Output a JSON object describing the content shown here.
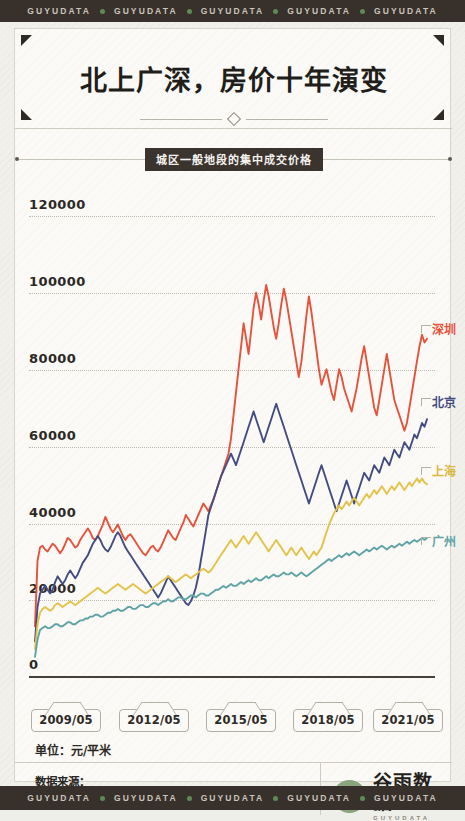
{
  "watermark": {
    "text": "GUYUDATA",
    "repeat": 5,
    "dot_color": "#5f8a58",
    "bar_color": "#38302b"
  },
  "header": {
    "title": "北上广深，房价十年演变",
    "subtitle": "城区一般地段的集中成交价格"
  },
  "axis": {
    "unit_label": "单位：元/平米",
    "zero_label": "0",
    "y_ticks": [
      "120000",
      "100000",
      "80000",
      "60000",
      "40000",
      "20000"
    ],
    "x_ticks": [
      "2009/05",
      "2012/05",
      "2015/05",
      "2018/05",
      "2021/05"
    ]
  },
  "legend": [
    {
      "name": "深圳",
      "color": "#e6523c"
    },
    {
      "name": "北京",
      "color": "#434c80"
    },
    {
      "name": "上海",
      "color": "#e3c34a"
    },
    {
      "name": "广州",
      "color": "#5fa3a5"
    }
  ],
  "footer": {
    "source_title": "数据来源：",
    "source_body": "国家信息中心 · 房地产信息网",
    "brand_cn": "谷雨数据",
    "brand_en": "GUYUDATA"
  },
  "chart_data": {
    "type": "line",
    "title": "北上广深，房价十年演变",
    "subtitle": "城区一般地段的集中成交价格",
    "xlabel": "",
    "ylabel": "元/平米",
    "ylim": [
      0,
      120000
    ],
    "xlim": [
      "2009/05",
      "2021/05"
    ],
    "grid": "horizontal-dotted",
    "legend_position": "right-inline",
    "y_tick_values": [
      0,
      20000,
      40000,
      60000,
      80000,
      100000,
      120000
    ],
    "x_tick_labels": [
      "2009/05",
      "2012/05",
      "2015/05",
      "2018/05",
      "2021/05"
    ],
    "x_start_month": "2009/05",
    "x_end_month": "2021/05",
    "series": [
      {
        "name": "深圳",
        "color": "#e6523c",
        "values": [
          13000,
          30000,
          33500,
          34000,
          33000,
          32500,
          33500,
          34500,
          34000,
          33000,
          32000,
          33000,
          34500,
          36000,
          35500,
          34500,
          33500,
          34000,
          35500,
          36500,
          37500,
          38500,
          37500,
          36000,
          35500,
          36500,
          38000,
          39500,
          41500,
          40000,
          38500,
          37500,
          38500,
          39500,
          38000,
          36500,
          35500,
          36500,
          37000,
          36000,
          35000,
          34000,
          33000,
          32000,
          31500,
          32500,
          33500,
          34000,
          33000,
          32500,
          33500,
          35000,
          36500,
          38000,
          37000,
          36000,
          35500,
          37000,
          38500,
          40000,
          42000,
          41000,
          40000,
          39000,
          40500,
          42000,
          43500,
          45000,
          44000,
          43000,
          44500,
          46000,
          48000,
          50000,
          52000,
          54000,
          56000,
          58000,
          62000,
          68000,
          74000,
          80000,
          86000,
          92000,
          88000,
          84000,
          90000,
          96000,
          100000,
          97000,
          93000,
          98000,
          102000,
          99000,
          95000,
          91000,
          88000,
          92000,
          97000,
          101000,
          98000,
          94000,
          90000,
          86000,
          82000,
          78000,
          82000,
          88000,
          94000,
          99000,
          95000,
          90000,
          85000,
          80000,
          76000,
          78000,
          80000,
          77000,
          74000,
          72000,
          76000,
          80000,
          78000,
          75000,
          73000,
          71000,
          69000,
          72000,
          75000,
          79000,
          83000,
          86000,
          82000,
          78000,
          74000,
          70000,
          68000,
          72000,
          76000,
          80000,
          84000,
          80000,
          76000,
          72000,
          70000,
          68000,
          66000,
          64000,
          66000,
          70000,
          74000,
          78000,
          82000,
          86000,
          89000,
          87000,
          88000
        ],
        "start_value": 13000,
        "end_value": 88000,
        "peak_value": 102000,
        "peak_label": "2016"
      },
      {
        "name": "北京",
        "color": "#434c80",
        "values": [
          9000,
          18000,
          21500,
          22500,
          23500,
          22500,
          21500,
          22500,
          24500,
          26000,
          25000,
          24000,
          25000,
          26500,
          27500,
          26500,
          25500,
          26500,
          28000,
          29500,
          30500,
          31500,
          33000,
          34500,
          35500,
          36500,
          35500,
          34000,
          33000,
          32500,
          33500,
          35000,
          36500,
          37500,
          36500,
          35000,
          33500,
          32500,
          31500,
          30500,
          29500,
          28500,
          27500,
          26500,
          25500,
          24500,
          23500,
          22500,
          21500,
          20500,
          21500,
          23000,
          24500,
          26000,
          25000,
          24000,
          23000,
          22000,
          21000,
          20000,
          19000,
          18500,
          19500,
          21000,
          23000,
          26000,
          30000,
          34000,
          38000,
          42000,
          44000,
          46000,
          48000,
          50000,
          52000,
          53500,
          55000,
          56500,
          58000,
          56500,
          55000,
          57000,
          59000,
          61000,
          63000,
          65000,
          67000,
          69000,
          67000,
          65000,
          63000,
          61000,
          63000,
          65000,
          67000,
          69000,
          71000,
          69000,
          67000,
          65000,
          63000,
          61000,
          59000,
          57000,
          55000,
          53000,
          51000,
          49000,
          47000,
          45000,
          47000,
          49000,
          51000,
          53000,
          55000,
          53000,
          51000,
          49000,
          47000,
          45000,
          43000,
          45000,
          47000,
          49000,
          51000,
          49000,
          47000,
          45000,
          47000,
          49000,
          51000,
          53000,
          52000,
          51000,
          53000,
          55000,
          54000,
          53000,
          55000,
          57000,
          56000,
          55000,
          57000,
          59000,
          58000,
          57000,
          59000,
          61000,
          60000,
          59000,
          61000,
          63000,
          62000,
          64000,
          66000,
          65000,
          67000
        ],
        "start_value": 9000,
        "end_value": 67000,
        "peak_value": 71000
      },
      {
        "name": "上海",
        "color": "#e3c34a",
        "values": [
          7000,
          13500,
          16500,
          17500,
          18000,
          17500,
          17000,
          17500,
          18500,
          19000,
          18500,
          18000,
          18500,
          19000,
          19500,
          19000,
          18500,
          19000,
          19500,
          20000,
          20500,
          21000,
          21500,
          22000,
          22500,
          23000,
          22500,
          22000,
          21500,
          22000,
          22500,
          23000,
          23500,
          24000,
          23500,
          23000,
          22500,
          23000,
          23500,
          24000,
          23500,
          23000,
          22500,
          22000,
          21500,
          22000,
          22500,
          23000,
          23500,
          24000,
          24500,
          25000,
          25500,
          26000,
          25500,
          25000,
          24500,
          25000,
          25500,
          26000,
          26500,
          26000,
          25500,
          26000,
          26500,
          27000,
          27500,
          28000,
          27500,
          27000,
          27500,
          28500,
          29500,
          30500,
          31500,
          32500,
          33500,
          34500,
          35500,
          34500,
          33500,
          34500,
          35500,
          36500,
          35500,
          34500,
          35500,
          36500,
          37500,
          36500,
          35500,
          34500,
          33500,
          32500,
          33500,
          34500,
          35500,
          34500,
          33500,
          32500,
          31500,
          32500,
          33500,
          32500,
          31500,
          32500,
          33500,
          32500,
          31500,
          30500,
          31500,
          32500,
          31500,
          32500,
          33500,
          35500,
          37500,
          39500,
          41000,
          42500,
          43500,
          44500,
          43500,
          44500,
          45500,
          44500,
          45500,
          46500,
          45500,
          44500,
          45500,
          46500,
          47500,
          46500,
          47500,
          48500,
          47500,
          48500,
          49500,
          48500,
          47500,
          48500,
          49500,
          48500,
          49500,
          50500,
          49500,
          48500,
          49500,
          50500,
          49500,
          50500,
          51500,
          50500,
          51500,
          50500,
          50000
        ],
        "start_value": 7000,
        "end_value": 50000
      },
      {
        "name": "广州",
        "color": "#5fa3a5",
        "values": [
          5000,
          9500,
          12000,
          12500,
          13000,
          12500,
          12500,
          13000,
          13500,
          13500,
          13000,
          13000,
          13500,
          14000,
          14000,
          13500,
          13500,
          14000,
          14500,
          14500,
          15000,
          15000,
          15500,
          15500,
          16000,
          16000,
          15500,
          15500,
          16000,
          16500,
          16500,
          17000,
          17000,
          17500,
          17000,
          17000,
          17500,
          18000,
          18000,
          17500,
          17500,
          18000,
          18500,
          18500,
          18000,
          18000,
          18500,
          19000,
          19000,
          18500,
          19000,
          19500,
          19500,
          20000,
          19500,
          19500,
          20000,
          20500,
          20500,
          20000,
          20000,
          20500,
          21000,
          21000,
          20500,
          21000,
          21500,
          21500,
          21000,
          21000,
          21500,
          22000,
          22500,
          22500,
          23000,
          23500,
          23000,
          23500,
          24000,
          23500,
          23500,
          24000,
          24500,
          24000,
          24500,
          25000,
          24500,
          25000,
          25500,
          25000,
          25000,
          25500,
          26000,
          25500,
          26000,
          26500,
          26000,
          26000,
          26500,
          27000,
          26500,
          26500,
          27000,
          26500,
          26000,
          26500,
          27000,
          26500,
          26000,
          26500,
          27000,
          27500,
          28000,
          28500,
          29000,
          29500,
          30000,
          30500,
          30000,
          30500,
          31000,
          31500,
          31000,
          31500,
          32000,
          31500,
          32000,
          32500,
          32000,
          31500,
          32000,
          32500,
          33000,
          32500,
          33000,
          33500,
          33000,
          33500,
          34000,
          33500,
          33000,
          33500,
          34000,
          33500,
          34000,
          34500,
          34000,
          34500,
          35000,
          34500,
          35000,
          35500,
          35000,
          35500,
          36000,
          35500,
          36000
        ],
        "start_value": 5000,
        "end_value": 36000
      }
    ]
  }
}
